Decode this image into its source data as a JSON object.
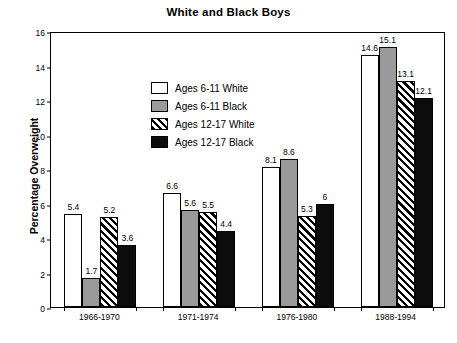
{
  "chart_data": {
    "type": "bar",
    "title": "White and Black Boys",
    "xlabel": "",
    "ylabel": "Percentage Overweight",
    "ylim": [
      0,
      16
    ],
    "ytick_step": 2,
    "yticks": [
      "0",
      "2",
      "4",
      "6",
      "8",
      "10",
      "12",
      "14",
      "16"
    ],
    "grid": false,
    "legend_position": "upper-left-inside",
    "categories": [
      "1966-1970",
      "1971-1974",
      "1976-1980",
      "1988-1994"
    ],
    "series": [
      {
        "name": "Ages  6-11 White",
        "fill": "white",
        "values": [
          5.4,
          6.6,
          8.1,
          14.6
        ],
        "labels": [
          "5.4",
          "6.6",
          "8.1",
          "14.6"
        ]
      },
      {
        "name": "Ages 6-11 Black",
        "fill": "gray",
        "values": [
          1.7,
          5.6,
          8.6,
          15.1
        ],
        "labels": [
          "1.7",
          "5.6",
          "8.6",
          "15.1"
        ]
      },
      {
        "name": "Ages 12-17 White",
        "fill": "hatch",
        "values": [
          5.2,
          5.5,
          5.3,
          13.1
        ],
        "labels": [
          "5.2",
          "5.5",
          "5.3",
          "13.1"
        ]
      },
      {
        "name": "Ages 12-17 Black",
        "fill": "black",
        "values": [
          3.6,
          4.4,
          6.0,
          12.1
        ],
        "labels": [
          "3.6",
          "4.4",
          "6",
          "12.1"
        ]
      }
    ]
  },
  "colors": {
    "white_fill": "#ffffff",
    "gray_fill": "#9a9a9a",
    "black_fill": "#0c0c0c",
    "axis": "#000000",
    "background": "#ffffff"
  }
}
